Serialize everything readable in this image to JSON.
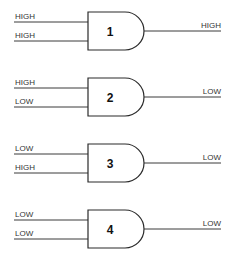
{
  "diagram": {
    "type": "logic-gates",
    "gate_kind": "AND",
    "gates": [
      {
        "number": "1",
        "input_a": "HIGH",
        "input_b": "HIGH",
        "output": "HIGH"
      },
      {
        "number": "2",
        "input_a": "HIGH",
        "input_b": "LOW",
        "output": "LOW"
      },
      {
        "number": "3",
        "input_a": "LOW",
        "input_b": "HIGH",
        "output": "LOW"
      },
      {
        "number": "4",
        "input_a": "LOW",
        "input_b": "LOW",
        "output": "LOW"
      }
    ]
  },
  "colors": {
    "line": "#3a3a3a",
    "text": "#333333",
    "background": "#ffffff"
  }
}
